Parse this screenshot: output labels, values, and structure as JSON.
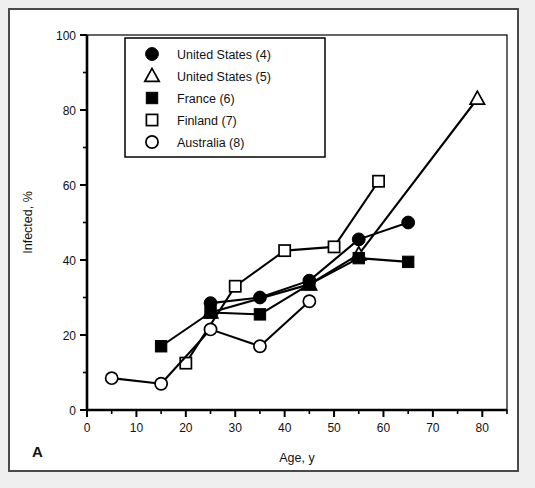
{
  "figure": {
    "panel_label": "A",
    "frame_color": "#4a4a4a",
    "background": "#ffffff",
    "outer_background": "#efefef",
    "ink_color": "#000000"
  },
  "chart_data": {
    "type": "line",
    "title": "",
    "subtitle": "",
    "xlabel": "Age, y",
    "ylabel": "Infected, %",
    "xlim": [
      0,
      85
    ],
    "ylim": [
      0,
      100
    ],
    "xticks": [
      0,
      10,
      20,
      30,
      40,
      50,
      60,
      70,
      80
    ],
    "yticks": [
      0,
      20,
      40,
      60,
      80,
      100
    ],
    "xtick_labels": [
      "0",
      "10",
      "20",
      "30",
      "40",
      "50",
      "60",
      "70",
      "80"
    ],
    "ytick_labels": [
      "0",
      "20",
      "40",
      "60",
      "80",
      "100"
    ],
    "x_minor_step": 5,
    "y_minor_step": 10,
    "grid": false,
    "legend_position": "upper-left-inside",
    "series": [
      {
        "name": "United States (4)",
        "marker": "filled-circle",
        "x": [
          25,
          35,
          45,
          55,
          65
        ],
        "y": [
          28.5,
          30,
          34.5,
          45.5,
          50
        ]
      },
      {
        "name": "United States (5)",
        "marker": "open-triangle",
        "x": [
          25,
          45,
          55,
          79
        ],
        "y": [
          26,
          33.5,
          41.5,
          83
        ]
      },
      {
        "name": "France (6)",
        "marker": "filled-square",
        "x": [
          15,
          25,
          35,
          45,
          55,
          65
        ],
        "y": [
          17,
          26,
          25.5,
          33.5,
          40.5,
          39.5
        ]
      },
      {
        "name": "Finland (7)",
        "marker": "open-square",
        "x": [
          20,
          30,
          40,
          50,
          59
        ],
        "y": [
          12.5,
          33,
          42.5,
          43.5,
          61
        ]
      },
      {
        "name": "Australia (8)",
        "marker": "open-circle",
        "x": [
          5,
          15,
          25,
          35,
          45
        ],
        "y": [
          8.5,
          7,
          21.5,
          17,
          29
        ]
      }
    ]
  },
  "legend": {
    "entries": [
      {
        "label": "United States (4)",
        "marker": "filled-circle"
      },
      {
        "label": "United States (5)",
        "marker": "open-triangle"
      },
      {
        "label": "France (6)",
        "marker": "filled-square"
      },
      {
        "label": "Finland (7)",
        "marker": "open-square"
      },
      {
        "label": "Australia (8)",
        "marker": "open-circle"
      }
    ]
  }
}
